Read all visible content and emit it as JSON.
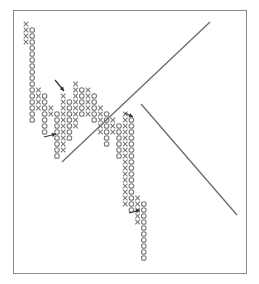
{
  "chart_data": {
    "type": "point-and-figure",
    "title": "",
    "xlabel": "",
    "ylabel": "",
    "grid": false,
    "colors": {
      "symbol": "#7a7a7a",
      "trendline": "#6a6a6a",
      "arrow": "#333333",
      "frame": "#8a8a8a"
    },
    "box": {
      "x0": 26,
      "y0": 24,
      "dx": 6.2,
      "dy": 6.0
    },
    "columns": [
      {
        "type": "X",
        "from": 0,
        "to": 3
      },
      {
        "type": "O",
        "from": 1,
        "to": 16
      },
      {
        "type": "X",
        "from": 11,
        "to": 14
      },
      {
        "type": "O",
        "from": 12,
        "to": 18
      },
      {
        "type": "X",
        "from": 14,
        "to": 15
      },
      {
        "type": "O",
        "from": 15,
        "to": 22
      },
      {
        "type": "X",
        "from": 12,
        "to": 21
      },
      {
        "type": "O",
        "from": 13,
        "to": 19
      },
      {
        "type": "X",
        "from": 10,
        "to": 17
      },
      {
        "type": "O",
        "from": 11,
        "to": 15
      },
      {
        "type": "X",
        "from": 11,
        "to": 15
      },
      {
        "type": "O",
        "from": 12,
        "to": 16
      },
      {
        "type": "X",
        "from": 14,
        "to": 18
      },
      {
        "type": "O",
        "from": 15,
        "to": 20
      },
      {
        "type": "X",
        "from": 16,
        "to": 18
      },
      {
        "type": "O",
        "from": 17,
        "to": 22
      },
      {
        "type": "X",
        "from": 15,
        "to": 30
      },
      {
        "type": "O",
        "from": 16,
        "to": 31
      },
      {
        "type": "X",
        "from": 29,
        "to": 33
      },
      {
        "type": "O",
        "from": 30,
        "to": 39
      }
    ],
    "trendlines": [
      {
        "name": "bullish-support-line",
        "x1": 62,
        "y1": 162,
        "x2": 210,
        "y2": 22
      },
      {
        "name": "bearish-resistance-line",
        "x1": 141,
        "y1": 104,
        "x2": 237,
        "y2": 215
      }
    ],
    "arrows": [
      {
        "name": "arrow-1",
        "x1": 55,
        "y1": 80,
        "x2": 64,
        "y2": 91
      },
      {
        "name": "arrow-2",
        "x1": 44,
        "y1": 137,
        "x2": 56,
        "y2": 134
      },
      {
        "name": "arrow-3",
        "x1": 125,
        "y1": 113,
        "x2": 133,
        "y2": 117
      },
      {
        "name": "arrow-4",
        "x1": 129,
        "y1": 213,
        "x2": 140,
        "y2": 210
      }
    ]
  }
}
